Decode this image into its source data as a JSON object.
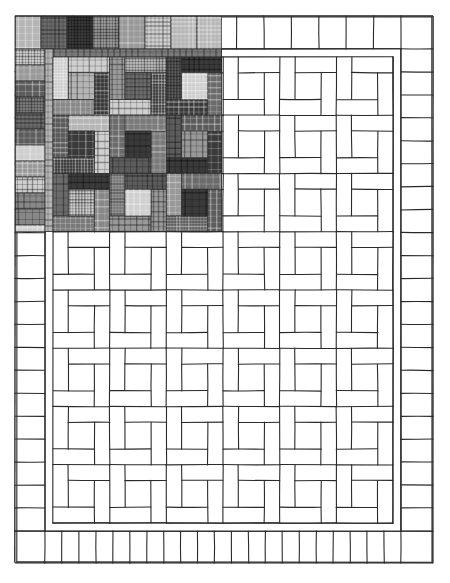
{
  "illustration": {
    "subject": "Quilt pattern drawing with a partially colored plaid section",
    "canvas": {
      "width": 450,
      "height": 583,
      "background": "#ffffff"
    },
    "line_color": "#2a2a2a",
    "outer_frame": {
      "x": 15,
      "y": 16,
      "w": 418,
      "h": 547
    },
    "border": {
      "top": {
        "y0": 16,
        "y1": 49,
        "x0": 45,
        "x1": 401,
        "key_count": 13
      },
      "bottom": {
        "y0": 531,
        "y1": 563,
        "x0": 45,
        "x1": 401,
        "key_count": 21
      },
      "left": {
        "x0": 15,
        "x1": 45,
        "y0": 49,
        "y1": 531,
        "bar_count": 21
      },
      "right": {
        "x0": 401,
        "x1": 433,
        "y0": 49,
        "y1": 531,
        "bar_count": 21
      }
    },
    "sashing": {
      "outer": {
        "x": 45,
        "y": 49,
        "w": 356,
        "h": 482
      },
      "inner": {
        "x": 53,
        "y": 57,
        "w": 340,
        "h": 466
      }
    },
    "blocks": {
      "columns": 6,
      "rows": 8,
      "pattern": "woven rail pinwheel"
    },
    "plaid_patch": {
      "x": 15,
      "y": 16,
      "w": 207,
      "h": 216,
      "palette": [
        "#3a3a3a",
        "#5c5c5c",
        "#7a7a7a",
        "#999999",
        "#b5b5b5",
        "#cfcfcf",
        "#6b6b6b",
        "#888888"
      ]
    }
  }
}
